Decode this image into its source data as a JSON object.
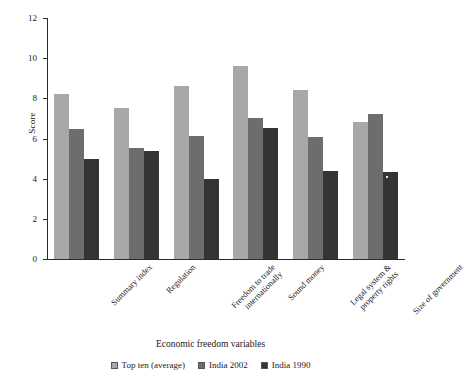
{
  "chart_data": {
    "type": "bar",
    "title": "",
    "xlabel": "Economic freedom variables",
    "ylabel": "Score",
    "ylim": [
      0,
      12
    ],
    "yticks": [
      0,
      2,
      4,
      6,
      8,
      10,
      12
    ],
    "grid": false,
    "legend_position": "bottom",
    "categories": [
      "Summary index",
      "Regulation",
      "Freedom to trade internationally",
      "Sound money",
      "Legal system & property rights",
      "Size of government"
    ],
    "category_lines": [
      [
        "Summary index"
      ],
      [
        "Regulation"
      ],
      [
        "Freedom to trade",
        "internationally"
      ],
      [
        "Sound money"
      ],
      [
        "Legal system &",
        "property rights"
      ],
      [
        "Size of government"
      ]
    ],
    "series": [
      {
        "name": "Top ten (average)",
        "color": "#a8a8a8",
        "values": [
          8.2,
          7.5,
          8.6,
          9.6,
          8.4,
          6.8
        ]
      },
      {
        "name": "India 2002",
        "color": "#6d6d6d",
        "values": [
          6.45,
          5.55,
          6.15,
          7.0,
          6.1,
          7.2
        ]
      },
      {
        "name": "India 1990",
        "color": "#343434",
        "values": [
          5.0,
          5.4,
          4.0,
          6.5,
          4.4,
          4.35
        ]
      }
    ]
  }
}
